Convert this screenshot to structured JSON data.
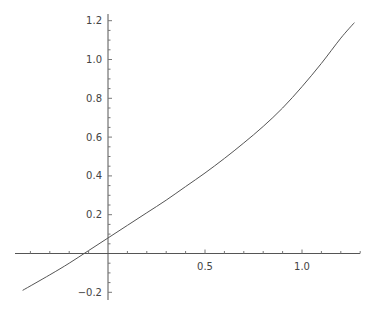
{
  "chart_data": {
    "type": "line",
    "title": "",
    "xlabel": "",
    "ylabel": "",
    "xlim": [
      -0.47,
      1.3
    ],
    "ylim": [
      -0.24,
      1.22
    ],
    "grid": false,
    "x_ticks": [
      0.5,
      1.0
    ],
    "x_tick_labels": [
      "0.5",
      "1.0"
    ],
    "x_minor_step": 0.1,
    "y_ticks": [
      -0.2,
      0.2,
      0.4,
      0.6,
      0.8,
      1.0,
      1.2
    ],
    "y_tick_labels": [
      "-0.2",
      "0.2",
      "0.4",
      "0.6",
      "0.8",
      "1.0",
      "1.2"
    ],
    "y_minor_step": 0.05,
    "series": [
      {
        "name": "curve",
        "x": [
          -0.44,
          -0.3,
          -0.2,
          -0.1,
          0.0,
          0.1,
          0.2,
          0.3,
          0.4,
          0.5,
          0.6,
          0.7,
          0.8,
          0.9,
          1.0,
          1.1,
          1.2,
          1.27
        ],
        "y": [
          -0.19,
          -0.11,
          -0.05,
          0.015,
          0.08,
          0.145,
          0.21,
          0.275,
          0.345,
          0.415,
          0.49,
          0.57,
          0.655,
          0.75,
          0.86,
          0.98,
          1.11,
          1.19
        ]
      }
    ]
  }
}
